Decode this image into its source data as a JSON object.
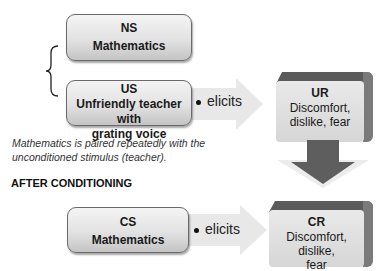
{
  "before": {
    "ns_box": {
      "label": "NS",
      "text": "Mathematics"
    },
    "us_box": {
      "label": "US",
      "line1": "Unfriendly teacher with",
      "line2": "grating voice"
    },
    "arrow_label": "elicits",
    "ur_box": {
      "label": "UR",
      "line1": "Discomfort,",
      "line2": "dislike, fear"
    },
    "note_line1": "Mathematics is paired repeatedly with the",
    "note_line2": "unconditioned stimulus (teacher)."
  },
  "after": {
    "heading": "AFTER CONDITIONING",
    "cs_box": {
      "label": "CS",
      "text": "Mathematics"
    },
    "arrow_label": "elicits",
    "cr_box": {
      "label": "CR",
      "line1": "Discomfort, dislike,",
      "line2": "fear"
    }
  },
  "colors": {
    "arrow_fill": "#e6e6e6",
    "down_arrow": "#5e5e5e",
    "cube_top": "#5b5b5b",
    "box_border": "#6a6a6a"
  }
}
